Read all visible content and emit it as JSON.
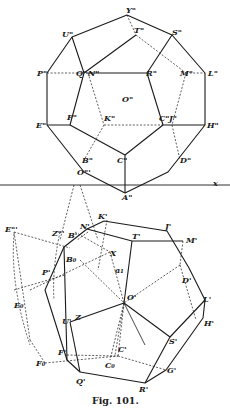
{
  "caption": "Fig. 101.",
  "axis_label": "x",
  "upper_view": {
    "labels": {
      "Y": "Y\"",
      "U": "U\"",
      "T": "T\"",
      "S": "S\"",
      "P": "P\"",
      "Q": "Q\"",
      "N": "N\"",
      "R": "R\"",
      "M": "M\"",
      "L": "L\"",
      "O": "O\"",
      "E": "E\"",
      "F": "F\"",
      "K": "K\"",
      "C": "C\"",
      "J": "J\"",
      "H": "H\"",
      "B": "B\"",
      "C2": "C\"",
      "D": "D\"",
      "A": "A\"",
      "O3": "O\"'"
    }
  },
  "lower_view": {
    "labels": {
      "E3": "E\"'",
      "Z3": "Z\"'",
      "N": "N'",
      "K": "K'",
      "J": "J'",
      "T": "T'",
      "M": "M'",
      "B": "B'",
      "B0": "B₀",
      "X": "X",
      "a1": "a₁",
      "P": "P'",
      "D": "D'",
      "E0": "E₀",
      "Zs": "Z",
      "O": "O'",
      "L": "L'",
      "H": "H'",
      "U": "U'",
      "Z0": "Z₀",
      "S": "S'",
      "F": "F'",
      "C": "C'",
      "F0": "F₀",
      "C0": "C₀",
      "G": "G'",
      "Q": "Q'",
      "R": "R'"
    }
  }
}
